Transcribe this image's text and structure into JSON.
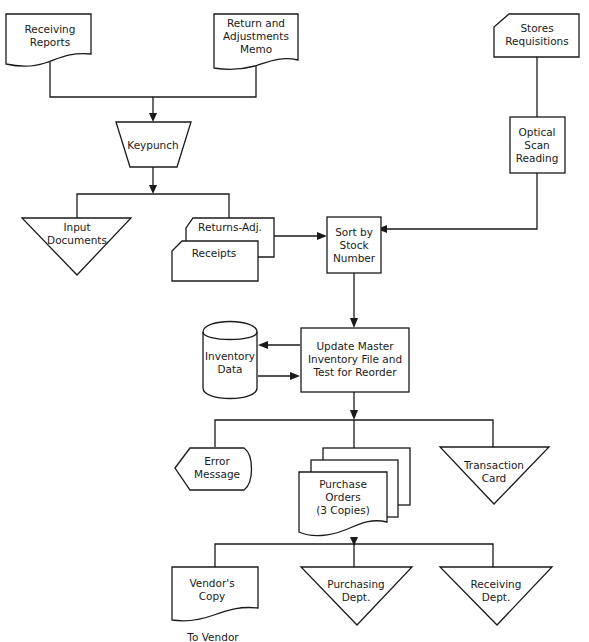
{
  "diagram": {
    "type": "system-flowchart",
    "nodes": {
      "receiving_reports": {
        "shape": "document",
        "lines": [
          "Receiving",
          "Reports"
        ]
      },
      "return_memo": {
        "shape": "document",
        "lines": [
          "Return and",
          "Adjustments",
          "Memo"
        ]
      },
      "stores_requisitions": {
        "shape": "punched-card",
        "lines": [
          "Stores",
          "Requisitions"
        ]
      },
      "keypunch": {
        "shape": "manual-operation",
        "lines": [
          "Keypunch"
        ]
      },
      "optical_scan": {
        "shape": "process",
        "lines": [
          "Optical",
          "Scan",
          "Reading"
        ]
      },
      "input_documents": {
        "shape": "offline-storage",
        "lines": [
          "Input",
          "Documents"
        ]
      },
      "returns_adj": {
        "shape": "punched-card",
        "lines": [
          "Returns-Adj."
        ]
      },
      "receipts": {
        "shape": "punched-card",
        "lines": [
          "Receipts"
        ]
      },
      "sort_stock": {
        "shape": "process",
        "lines": [
          "Sort by",
          "Stock",
          "Number"
        ]
      },
      "inventory_data": {
        "shape": "magnetic-disk",
        "lines": [
          "Inventory",
          "Data"
        ]
      },
      "update_master": {
        "shape": "process",
        "lines": [
          "Update Master",
          "Inventory File and",
          "Test for Reorder"
        ]
      },
      "error_message": {
        "shape": "display",
        "lines": [
          "Error",
          "Message"
        ]
      },
      "purchase_orders": {
        "shape": "multi-document",
        "lines": [
          "Purchase",
          "Orders",
          "(3 Copies)"
        ]
      },
      "transaction_card": {
        "shape": "offline-storage",
        "lines": [
          "Transaction",
          "Card"
        ]
      },
      "vendors_copy": {
        "shape": "document",
        "lines": [
          "Vendor's",
          "Copy"
        ]
      },
      "purchasing_dept": {
        "shape": "offline-storage",
        "lines": [
          "Purchasing",
          "Dept."
        ]
      },
      "receiving_dept": {
        "shape": "offline-storage",
        "lines": [
          "Receiving",
          "Dept."
        ]
      }
    },
    "captions": {
      "to_vendor": "To Vendor"
    },
    "edges": [
      [
        "receiving_reports",
        "keypunch"
      ],
      [
        "return_memo",
        "keypunch"
      ],
      [
        "keypunch",
        "input_documents"
      ],
      [
        "keypunch",
        "returns_adj"
      ],
      [
        "returns_adj",
        "sort_stock"
      ],
      [
        "stores_requisitions",
        "optical_scan"
      ],
      [
        "optical_scan",
        "sort_stock"
      ],
      [
        "sort_stock",
        "update_master"
      ],
      [
        "update_master",
        "inventory_data"
      ],
      [
        "inventory_data",
        "update_master"
      ],
      [
        "update_master",
        "error_message"
      ],
      [
        "update_master",
        "purchase_orders"
      ],
      [
        "update_master",
        "transaction_card"
      ],
      [
        "purchase_orders",
        "vendors_copy"
      ],
      [
        "purchase_orders",
        "purchasing_dept"
      ],
      [
        "purchase_orders",
        "receiving_dept"
      ]
    ]
  }
}
